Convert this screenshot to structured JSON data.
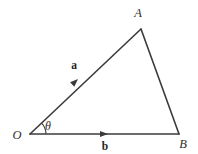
{
  "diagram": {
    "type": "vector-triangle",
    "background_color": "#ffffff",
    "stroke_color": "#3b3b3b",
    "label_color": "#2e2e2e",
    "canvas": {
      "width": 198,
      "height": 154
    },
    "vertices": [
      {
        "id": "O",
        "label": "O",
        "x": 30,
        "y": 134,
        "label_x": 17,
        "label_y": 138
      },
      {
        "id": "A",
        "label": "A",
        "x": 141,
        "y": 29,
        "label_x": 136,
        "label_y": 17
      },
      {
        "id": "B",
        "label": "B",
        "x": 179,
        "y": 134,
        "label_x": 180,
        "label_y": 147
      }
    ],
    "edges": [
      {
        "id": "OA",
        "from": "O",
        "to": "A",
        "path": "M 30 134 L 141 29"
      },
      {
        "id": "AB",
        "from": "A",
        "to": "B",
        "path": "M 141 29 L 179 134"
      },
      {
        "id": "OB",
        "from": "O",
        "to": "B",
        "path": "M 30 134 L 179 134"
      }
    ],
    "vectors": [
      {
        "id": "a",
        "label": "a",
        "on_edge": "OA",
        "arrow_x": 78,
        "arrow_y": 79,
        "arrow_angle_deg": -43.4,
        "label_x": 73,
        "label_y": 71
      },
      {
        "id": "b",
        "label": "b",
        "on_edge": "OB",
        "arrow_x": 108,
        "arrow_y": 134,
        "arrow_angle_deg": 0,
        "label_x": 104,
        "label_y": 149
      }
    ],
    "angle": {
      "id": "theta",
      "label": "θ",
      "at_vertex": "O",
      "radius": 16,
      "start_deg": 0,
      "end_deg": -43.4,
      "arc_path": "M 46 134 A 16 16 0 0 0 41.62 123.01",
      "label_x": 46,
      "label_y": 130
    }
  }
}
